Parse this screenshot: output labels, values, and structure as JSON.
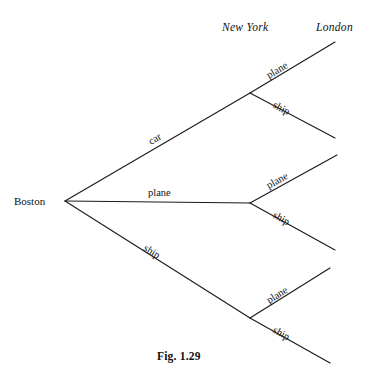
{
  "figure": {
    "caption": "Fig. 1.29",
    "caption_x": 157,
    "caption_y": 351
  },
  "chart_data": {
    "type": "diagram",
    "subtype": "probability-tree",
    "title": "Fig. 1.29",
    "stage_headers": [
      {
        "label": "New York",
        "x": 222,
        "y": 22
      },
      {
        "label": "London",
        "x": 316,
        "y": 22
      }
    ],
    "root": {
      "label": "Boston",
      "label_x": 14,
      "label_y": 196,
      "node_x": 65,
      "node_y": 201
    },
    "stage1_nodes": [
      {
        "id": "ny-top",
        "x": 250,
        "y": 93
      },
      {
        "id": "ny-mid",
        "x": 250,
        "y": 203
      },
      {
        "id": "ny-bot",
        "x": 250,
        "y": 318
      }
    ],
    "branches_stage1": [
      {
        "label": "car",
        "from": "boston",
        "to": "ny-top",
        "x1": 65,
        "y1": 201,
        "x2": 250,
        "y2": 93,
        "label_x": 147,
        "label_y": 138,
        "label_rot": -30.3
      },
      {
        "label": "plane",
        "from": "boston",
        "to": "ny-mid",
        "x1": 65,
        "y1": 201,
        "x2": 250,
        "y2": 203,
        "label_x": 148,
        "label_y": 188,
        "label_rot": 0
      },
      {
        "label": "ship",
        "from": "boston",
        "to": "ny-bot",
        "x1": 65,
        "y1": 201,
        "x2": 250,
        "y2": 318,
        "label_x": 147,
        "label_y": 243,
        "label_rot": 32.3
      }
    ],
    "branches_stage2": [
      {
        "label": "plane",
        "from": "ny-top",
        "x1": 250,
        "y1": 93,
        "x2": 335,
        "y2": 42,
        "label_x": 265,
        "label_y": 72,
        "label_rot": -31.0
      },
      {
        "label": "ship",
        "from": "ny-top",
        "x1": 250,
        "y1": 93,
        "x2": 335,
        "y2": 138,
        "label_x": 276,
        "label_y": 100,
        "label_rot": 27.9
      },
      {
        "label": "plane",
        "from": "ny-mid",
        "x1": 250,
        "y1": 203,
        "x2": 337,
        "y2": 155,
        "label_x": 265,
        "label_y": 182,
        "label_rot": -28.9
      },
      {
        "label": "ship",
        "from": "ny-mid",
        "x1": 250,
        "y1": 203,
        "x2": 335,
        "y2": 250,
        "label_x": 276,
        "label_y": 210,
        "label_rot": 28.9
      },
      {
        "label": "plane",
        "from": "ny-bot",
        "x1": 250,
        "y1": 318,
        "x2": 330,
        "y2": 268,
        "label_x": 265,
        "label_y": 297,
        "label_rot": -32.0
      },
      {
        "label": "ship",
        "from": "ny-bot",
        "x1": 250,
        "y1": 318,
        "x2": 330,
        "y2": 363,
        "label_x": 276,
        "label_y": 325,
        "label_rot": 29.4
      }
    ],
    "stroke_color": "#1a1a1a",
    "stroke_width": 1.1,
    "background": "#ffffff"
  }
}
